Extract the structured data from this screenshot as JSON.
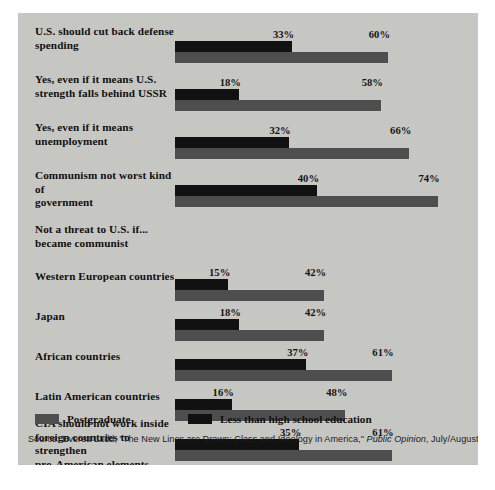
{
  "chart_data": {
    "type": "bar",
    "orientation": "horizontal",
    "title": "",
    "xlabel": "",
    "ylabel": "",
    "xlim": [
      0,
      80
    ],
    "grid": false,
    "legend_position": "bottom-left",
    "value_suffix": "%",
    "categories": [
      "U.S. should cut back defense spending",
      "Yes, even if it means U.S. strength falls behind USSR",
      "Yes, even if it means unemployment",
      "Communism not worst kind of government",
      "Western European countries",
      "Japan",
      "African countries",
      "Latin American countries",
      "CIA should not work inside foreign countries to strengthen pro-American elements"
    ],
    "series": [
      {
        "name": "Less than high school education",
        "color": "#111111",
        "values": [
          33,
          18,
          32,
          40,
          15,
          18,
          37,
          16,
          35
        ]
      },
      {
        "name": "Postgraduate",
        "color": "#4e4e4e",
        "values": [
          60,
          58,
          66,
          74,
          42,
          42,
          61,
          48,
          61
        ]
      }
    ],
    "annotations": [
      "Not a threat to U.S. if... became communist"
    ]
  },
  "panel": {
    "background": "#c8c8c5"
  },
  "rows": [
    {
      "id": "defense-spending",
      "label_line1": "U.S. should cut back defense",
      "label_line2": "spending",
      "is_section": false,
      "black_value": 33,
      "black_label": "33%",
      "gray_value": 60,
      "gray_label": "60%"
    },
    {
      "id": "strength-behind-ussr",
      "label_line1": "Yes, even if it means U.S.",
      "label_line2": "strength falls behind USSR",
      "is_section": false,
      "black_value": 18,
      "black_label": "18%",
      "gray_value": 58,
      "gray_label": "58%"
    },
    {
      "id": "unemployment",
      "label_line1": "Yes, even if it means",
      "label_line2": "unemployment",
      "is_section": false,
      "black_value": 32,
      "black_label": "32%",
      "gray_value": 66,
      "gray_label": "66%"
    },
    {
      "id": "communism-not-worst",
      "label_line1": "Communism not worst kind of",
      "label_line2": "government",
      "is_section": false,
      "black_value": 40,
      "black_label": "40%",
      "gray_value": 74,
      "gray_label": "74%"
    },
    {
      "id": "not-a-threat-header",
      "label_line1": "Not a threat to U.S. if...",
      "label_line2": "became communist",
      "is_section": true,
      "black_value": null,
      "black_label": "",
      "gray_value": null,
      "gray_label": ""
    },
    {
      "id": "western-european-countries",
      "label_line1": "Western European countries",
      "label_line2": "",
      "is_section": false,
      "black_value": 15,
      "black_label": "15%",
      "gray_value": 42,
      "gray_label": "42%"
    },
    {
      "id": "japan",
      "label_line1": "Japan",
      "label_line2": "",
      "is_section": false,
      "black_value": 18,
      "black_label": "18%",
      "gray_value": 42,
      "gray_label": "42%"
    },
    {
      "id": "african-countries",
      "label_line1": "African countries",
      "label_line2": "",
      "is_section": false,
      "black_value": 37,
      "black_label": "37%",
      "gray_value": 61,
      "gray_label": "61%"
    },
    {
      "id": "latin-american-countries",
      "label_line1": "Latin American countries",
      "label_line2": "",
      "is_section": false,
      "black_value": 16,
      "black_label": "16%",
      "gray_value": 48,
      "gray_label": "48%"
    },
    {
      "id": "cia-foreign-countries",
      "label_line1": "CIA should not work inside",
      "label_line2": "foreign countries to strengthen",
      "label_line3": "pro-American elements",
      "is_section": false,
      "black_value": 35,
      "black_label": "35%",
      "gray_value": 61,
      "gray_label": "61%"
    }
  ],
  "legend": {
    "postgraduate_label": "Postgraduate",
    "postgraduate_color": "#4e4e4e",
    "less_than_hs_label": "Less than high school education",
    "less_than_hs_color": "#111111"
  },
  "source": {
    "prefix": "Source:  Everett Ladd, \"The New Lines are Drawn:  Class and Ideology in America,\" ",
    "publication": "Public Opinion",
    "suffix": ", July/August, 1978, p. 52."
  }
}
